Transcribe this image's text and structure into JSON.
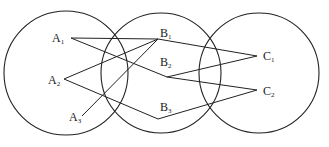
{
  "diagram": {
    "type": "set-mapping",
    "sets": [
      {
        "id": "A",
        "cx": 66,
        "cy": 73,
        "r": 62
      },
      {
        "id": "B",
        "cx": 161,
        "cy": 73,
        "r": 60
      },
      {
        "id": "C",
        "cx": 259,
        "cy": 73,
        "r": 60
      }
    ],
    "nodes": [
      {
        "id": "A1",
        "letter": "A",
        "sub": "1",
        "x": 71,
        "y": 38,
        "lx": 52,
        "ly": 42
      },
      {
        "id": "A2",
        "letter": "A",
        "sub": "2",
        "x": 64,
        "y": 79,
        "lx": 48,
        "ly": 84
      },
      {
        "id": "A3",
        "letter": "A",
        "sub": "3",
        "x": 82,
        "y": 116,
        "lx": 69,
        "ly": 121
      },
      {
        "id": "B1",
        "letter": "B",
        "sub": "1",
        "x": 158,
        "y": 39,
        "lx": 160,
        "ly": 37
      },
      {
        "id": "B2",
        "letter": "B",
        "sub": "2",
        "x": 167,
        "y": 77,
        "lx": 160,
        "ly": 66
      },
      {
        "id": "B3",
        "letter": "B",
        "sub": "3",
        "x": 158,
        "y": 119,
        "lx": 160,
        "ly": 111
      },
      {
        "id": "C1",
        "letter": "C",
        "sub": "1",
        "x": 257,
        "y": 56,
        "lx": 263,
        "ly": 60
      },
      {
        "id": "C2",
        "letter": "C",
        "sub": "2",
        "x": 257,
        "y": 90,
        "lx": 263,
        "ly": 95
      }
    ],
    "edges": [
      [
        "A1",
        "B1"
      ],
      [
        "A1",
        "B2"
      ],
      [
        "A2",
        "B1"
      ],
      [
        "A2",
        "B3"
      ],
      [
        "A3",
        "B1"
      ],
      [
        "B1",
        "C1"
      ],
      [
        "B2",
        "C1"
      ],
      [
        "B2",
        "C2"
      ],
      [
        "B3",
        "C2"
      ]
    ]
  }
}
